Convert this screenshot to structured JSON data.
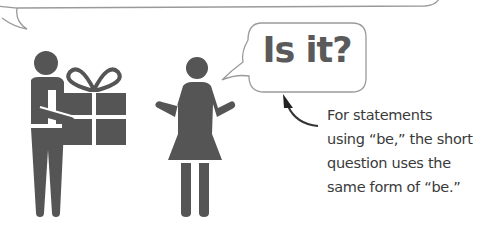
{
  "speech_bubble": {
    "text": "Is it?"
  },
  "annotation": {
    "lines": [
      "For statements",
      "using “be,” the short",
      "question uses the",
      "same form of “be.”"
    ]
  },
  "figures": {
    "left": "man-holding-gift",
    "right": "woman-shrugging"
  },
  "colors": {
    "figure": "#555555",
    "bubble_outline": "#9a9a9a",
    "text": "#3a3a3a",
    "arrow": "#333333"
  }
}
